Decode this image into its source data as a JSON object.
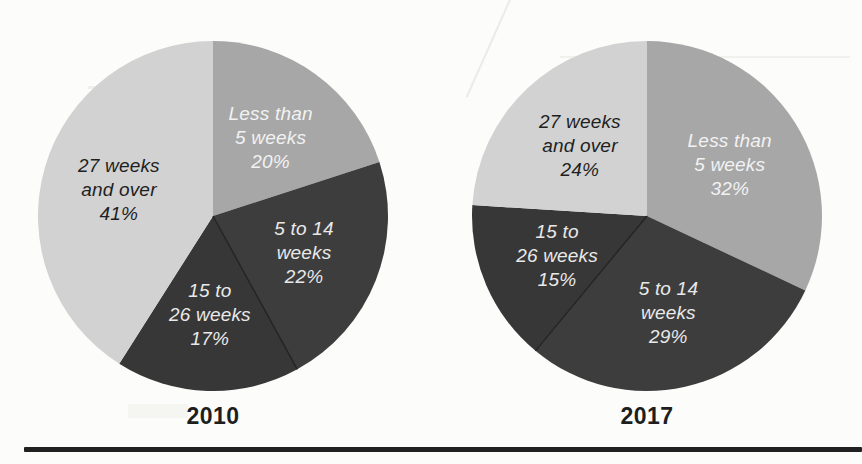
{
  "page": {
    "background_color": "#fcfcfa",
    "bottom_rule_color": "#212121"
  },
  "chart_data": [
    {
      "type": "pie",
      "title": "2010",
      "legend_position": "none",
      "labels_inside": true,
      "categories": [
        "Less than 5 weeks",
        "5 to 14 weeks",
        "15 to 26 weeks",
        "27 weeks and over"
      ],
      "values": [
        20,
        22,
        17,
        41
      ],
      "slices": [
        {
          "label": "Less than 5 weeks",
          "lines": [
            "Less than",
            "5 weeks"
          ],
          "value": 20,
          "pct": "20%",
          "color": "#a7a7a7",
          "text_color": "#f2f2f2"
        },
        {
          "label": "5 to 14 weeks",
          "lines": [
            "5 to 14",
            "weeks"
          ],
          "value": 22,
          "pct": "22%",
          "color": "#3d3d3d",
          "text_color": "#e9e9e9"
        },
        {
          "label": "15 to 26 weeks",
          "lines": [
            "15 to",
            "26 weeks"
          ],
          "value": 17,
          "pct": "17%",
          "color": "#373737",
          "text_color": "#e9e9e9"
        },
        {
          "label": "27 weeks and over",
          "lines": [
            "27 weeks",
            "and over"
          ],
          "value": 41,
          "pct": "41%",
          "color": "#d2d2d2",
          "text_color": "#1f1f1f"
        }
      ]
    },
    {
      "type": "pie",
      "title": "2017",
      "legend_position": "none",
      "labels_inside": true,
      "categories": [
        "Less than 5 weeks",
        "5 to 14 weeks",
        "15 to 26 weeks",
        "27 weeks and over"
      ],
      "values": [
        32,
        29,
        15,
        24
      ],
      "slices": [
        {
          "label": "Less than 5 weeks",
          "lines": [
            "Less than",
            "5 weeks"
          ],
          "value": 32,
          "pct": "32%",
          "color": "#a7a7a7",
          "text_color": "#f2f2f2"
        },
        {
          "label": "5 to 14 weeks",
          "lines": [
            "5 to 14",
            "weeks"
          ],
          "value": 29,
          "pct": "29%",
          "color": "#3d3d3d",
          "text_color": "#e9e9e9"
        },
        {
          "label": "15 to 26 weeks",
          "lines": [
            "15 to",
            "26 weeks"
          ],
          "value": 15,
          "pct": "15%",
          "color": "#373737",
          "text_color": "#e9e9e9"
        },
        {
          "label": "27 weeks and over",
          "lines": [
            "27 weeks",
            "and over"
          ],
          "value": 24,
          "pct": "24%",
          "color": "#d2d2d2",
          "text_color": "#1f1f1f"
        }
      ]
    }
  ]
}
